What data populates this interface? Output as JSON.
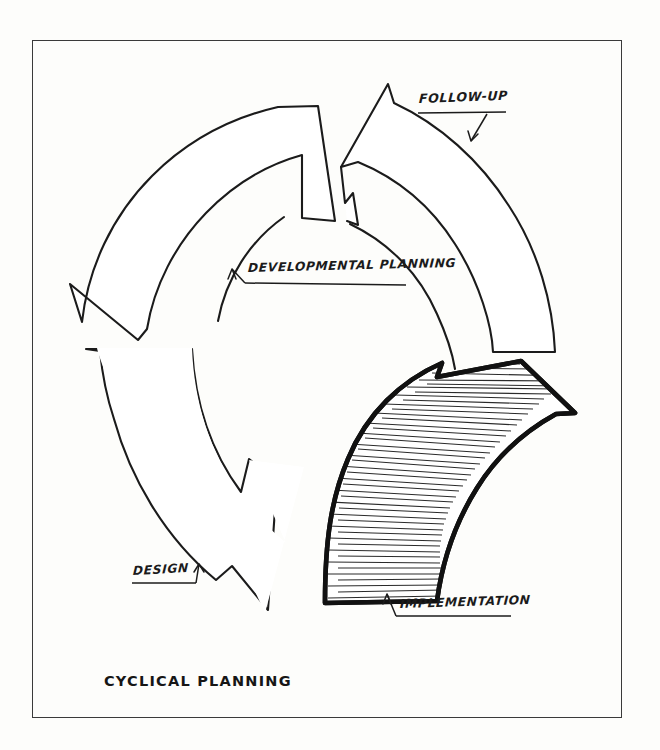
{
  "document": {
    "title": "CYCLICAL PLANNING",
    "frame": {
      "border_color": "#3a3a3a"
    },
    "background_color": "#fdfdfb",
    "ink_color": "#1b1b1b"
  },
  "diagram": {
    "type": "cyclical-process-diagram",
    "direction": "clockwise",
    "stages": [
      {
        "id": "follow-up",
        "label": "FOLLOW-UP",
        "position": "top-right",
        "filled": false,
        "hatched": false,
        "leader_arrow": "down-left"
      },
      {
        "id": "developmental-planning",
        "label": "DEVELOPMENTAL PLANNING",
        "position": "top-left",
        "filled": false,
        "hatched": false,
        "leader_arrow": "up-left"
      },
      {
        "id": "design",
        "label": "DESIGN",
        "position": "bottom-left",
        "filled": false,
        "hatched": false,
        "leader_arrow": "up-right"
      },
      {
        "id": "implementation",
        "label": "IMPLEMENTATION",
        "position": "bottom-right",
        "filled": false,
        "hatched": true,
        "emphasis": "heavy-outline-with-radial-hatching",
        "leader_arrow": "up-left"
      }
    ]
  }
}
